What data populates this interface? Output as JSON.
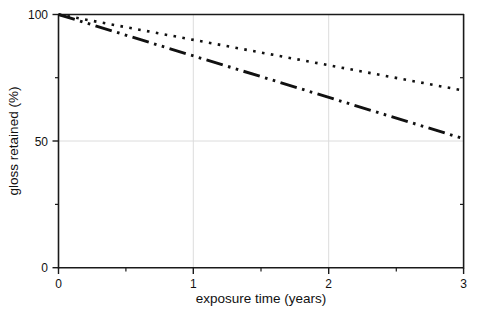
{
  "chart_data": {
    "type": "line",
    "title": "",
    "subtitle": "",
    "xlabel": "exposure time (years)",
    "ylabel": "gloss retained (%)",
    "xlim": [
      0,
      3
    ],
    "ylim": [
      0,
      100
    ],
    "x_ticks": [
      0,
      1,
      2,
      3
    ],
    "x_tick_labels": [
      "0",
      "1",
      "2",
      "3"
    ],
    "x_minor_ticks": [
      0.5,
      1.5,
      2.5
    ],
    "y_ticks": [
      0,
      50,
      100
    ],
    "y_tick_labels": [
      "0",
      "50",
      "100"
    ],
    "y_minor_ticks": [
      25,
      75
    ],
    "grid": {
      "enabled": true,
      "x_gridlines": [
        1,
        2
      ],
      "y_gridlines": [
        50
      ],
      "color": "#dcdcdc"
    },
    "legend": {
      "visible": false,
      "position": "none"
    },
    "x": [
      0,
      3
    ],
    "series": [
      {
        "name": "dotted",
        "style": "dotted",
        "color": "#111111",
        "values": [
          100,
          70
        ]
      },
      {
        "name": "dash-dot-dot",
        "style": "dashdotdot",
        "color": "#111111",
        "values": [
          100,
          51
        ]
      }
    ]
  },
  "labels": {
    "xlabel": "exposure time (years)",
    "ylabel": "gloss retained (%)",
    "x0": "0",
    "x1": "1",
    "x2": "2",
    "x3": "3",
    "y0": "0",
    "y50": "50",
    "y100": "100"
  }
}
